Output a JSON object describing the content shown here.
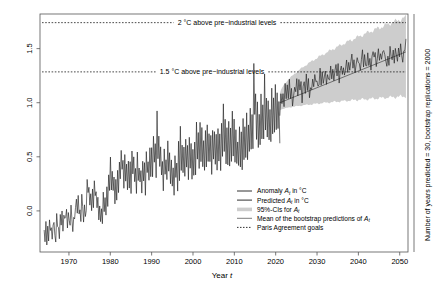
{
  "chart_data": {
    "type": "line",
    "title": "",
    "xlabel": "Year t",
    "ylabel": "",
    "xlim": [
      1963,
      2052
    ],
    "ylim": [
      -0.38,
      1.82
    ],
    "xticks": [
      "1970",
      "1980",
      "1990",
      "2000",
      "2010",
      "2020",
      "2030",
      "2040",
      "2050"
    ],
    "xtick_values": [
      1970,
      1980,
      1990,
      2000,
      2010,
      2020,
      2030,
      2040,
      2050
    ],
    "yticks": [
      "0.0",
      "0.5",
      "1.0",
      "1.5"
    ],
    "ytick_values": [
      0.0,
      0.5,
      1.0,
      1.5
    ],
    "grid": false,
    "legend_position": "bottom-right",
    "annotations": [
      {
        "label": "2 °C above pre−industrial levels",
        "y": 1.74,
        "style": "dotted"
      },
      {
        "label": "1.5 °C above pre−industrial levels",
        "y": 1.285,
        "style": "dotted"
      }
    ],
    "right_axis_note": "Number of years predicted = 30, bootstrap replications = 2000",
    "series": [
      {
        "name": "Anomaly A_t in °C",
        "type": "line",
        "color": "#1a1a1a",
        "x_start": 1964.0,
        "x_end": 2021.0,
        "values": [
          -0.22,
          -0.26,
          -0.14,
          -0.3,
          -0.18,
          -0.24,
          -0.1,
          -0.2,
          -0.12,
          -0.27,
          -0.15,
          -0.08,
          -0.18,
          -0.24,
          -0.05,
          -0.19,
          -0.12,
          -0.22,
          -0.08,
          -0.16,
          -0.04,
          -0.14,
          -0.06,
          -0.11,
          -0.1,
          -0.02,
          -0.15,
          0.02,
          -0.08,
          -0.13,
          0.04,
          -0.07,
          -0.16,
          -0.02,
          -0.09,
          0.01,
          0.06,
          -0.05,
          0.11,
          -0.03,
          0.02,
          -0.1,
          0.14,
          0.0,
          -0.06,
          0.08,
          -0.02,
          0.05,
          0.26,
          0.12,
          0.2,
          0.04,
          0.16,
          -0.02,
          0.22,
          0.07,
          0.3,
          0.1,
          0.18,
          0.0,
          0.1,
          -0.05,
          0.08,
          -0.12,
          0.02,
          -0.08,
          0.16,
          0.04,
          0.12,
          -0.04,
          0.2,
          0.06,
          0.34,
          0.16,
          0.46,
          0.22,
          0.38,
          0.14,
          0.3,
          0.05,
          0.26,
          0.1,
          0.42,
          0.2,
          0.5,
          0.28,
          0.6,
          0.34,
          0.44,
          0.2,
          0.52,
          0.3,
          0.4,
          0.18,
          0.48,
          0.26,
          0.42,
          0.2,
          0.55,
          0.3,
          0.46,
          0.24,
          0.38,
          0.16,
          0.5,
          0.28,
          0.44,
          0.22,
          0.35,
          0.14,
          0.48,
          0.26,
          0.4,
          0.18,
          0.58,
          0.32,
          0.5,
          0.28,
          0.62,
          0.36,
          0.54,
          0.3,
          0.7,
          0.42,
          0.6,
          0.34,
          0.88,
          0.5,
          0.66,
          0.38,
          0.58,
          0.3,
          0.46,
          0.22,
          0.56,
          0.3,
          0.48,
          0.24,
          0.62,
          0.34,
          0.54,
          0.28,
          0.45,
          0.2,
          0.38,
          0.14,
          0.52,
          0.26,
          0.44,
          0.2,
          0.6,
          0.32,
          0.78,
          0.42,
          0.64,
          0.36,
          0.56,
          0.3,
          0.68,
          0.38,
          0.58,
          0.32,
          0.72,
          0.4,
          0.62,
          0.34,
          0.56,
          0.3,
          0.66,
          0.36,
          0.86,
          0.48,
          0.7,
          0.4,
          0.8,
          0.44,
          0.74,
          0.42,
          0.64,
          0.36,
          0.7,
          0.4,
          0.82,
          0.46,
          0.76,
          0.42,
          0.68,
          0.38,
          0.78,
          0.44,
          0.7,
          0.4,
          0.66,
          0.36,
          0.76,
          0.42,
          0.7,
          0.38,
          0.84,
          0.46,
          1.02,
          0.56,
          0.8,
          0.46,
          0.72,
          0.4,
          0.82,
          0.46,
          0.76,
          0.42,
          0.88,
          0.5,
          0.8,
          0.46,
          0.74,
          0.42,
          0.68,
          0.4,
          0.78,
          0.44,
          0.72,
          0.42,
          0.86,
          0.5,
          0.8,
          0.46,
          0.9,
          0.52,
          0.84,
          0.5,
          0.96,
          0.56,
          0.9,
          0.54,
          1.38,
          0.88,
          1.1,
          0.7,
          0.98,
          0.62,
          0.9,
          0.58,
          1.06,
          0.68,
          1.0,
          0.64,
          1.24,
          0.78,
          1.08,
          0.7,
          1.0,
          0.66,
          0.94,
          0.62,
          1.1,
          0.72,
          1.02,
          0.68,
          1.16,
          0.76,
          1.06,
          0.72,
          0.98,
          0.66
        ]
      },
      {
        "name": "Predicted A_t in °C",
        "type": "line",
        "color": "#1a1a1a",
        "x_start": 2021.0,
        "x_end": 2051.5,
        "values": [
          0.86,
          1.08,
          0.96,
          1.12,
          1.0,
          1.16,
          1.04,
          1.2,
          1.08,
          1.18,
          1.02,
          1.14,
          0.98,
          1.1,
          1.18,
          1.06,
          1.2,
          1.1,
          1.22,
          1.08,
          1.16,
          1.04,
          1.12,
          1.2,
          1.1,
          1.24,
          1.12,
          1.2,
          1.08,
          1.18,
          1.1,
          1.22,
          1.14,
          1.26,
          1.16,
          1.24,
          1.12,
          1.2,
          1.28,
          1.18,
          1.26,
          1.16,
          1.22,
          1.3,
          1.2,
          1.28,
          1.18,
          1.24,
          1.32,
          1.22,
          1.3,
          1.2,
          1.26,
          1.34,
          1.24,
          1.32,
          1.22,
          1.3,
          1.38,
          1.28,
          1.34,
          1.24,
          1.3,
          1.4,
          1.3,
          1.36,
          1.26,
          1.34,
          1.42,
          1.3,
          1.38,
          1.28,
          1.36,
          1.44,
          1.34,
          1.4,
          1.3,
          1.38,
          1.46,
          1.36,
          1.42,
          1.32,
          1.38,
          1.46,
          1.38,
          1.44,
          1.34,
          1.42,
          1.5,
          1.4,
          1.46,
          1.36,
          1.42,
          1.5,
          1.42,
          1.48,
          1.38,
          1.46,
          1.52,
          1.44,
          1.4,
          1.34,
          1.46,
          1.38,
          1.5,
          1.42,
          1.36,
          1.48,
          1.4,
          1.52,
          1.44,
          1.38,
          1.5,
          1.42,
          1.54,
          1.46,
          1.4,
          1.52,
          1.44,
          1.56
        ]
      },
      {
        "name": "Mean of the bootstrap predictions of A_t",
        "type": "line",
        "color": "#6e6e6e",
        "x_start": 2021.0,
        "x_end": 2051.5,
        "y_start": 1.0,
        "y_end": 1.47
      },
      {
        "name": "95%-CIs for A_t",
        "type": "band",
        "color": "#cdcdcd",
        "x_start": 2021.0,
        "x_end": 2051.5,
        "lower_start": 0.93,
        "lower_end": 1.06,
        "upper_start": 1.08,
        "upper_end": 1.79
      }
    ],
    "legend": [
      {
        "label_prefix": "Anomaly ",
        "symbol": "A",
        "subscript": "t",
        "label_suffix": " in °C",
        "marker": "line",
        "color": "#1a1a1a"
      },
      {
        "label_prefix": "Predicted ",
        "symbol": "A",
        "subscript": "t",
        "label_suffix": " in °C",
        "marker": "line",
        "color": "#1a1a1a"
      },
      {
        "label_prefix": "95%-CIs for  ",
        "symbol": "A",
        "subscript": "t",
        "label_suffix": "",
        "marker": "band",
        "color": "#cdcdcd"
      },
      {
        "label_prefix": "Mean of the bootstrap predictions of ",
        "symbol": "A",
        "subscript": "t",
        "label_suffix": "",
        "marker": "line",
        "color": "#6e6e6e"
      },
      {
        "label_prefix": "Paris Agreement goals",
        "symbol": "",
        "subscript": "",
        "label_suffix": "",
        "marker": "dotted",
        "color": "#1a1a1a"
      }
    ]
  },
  "axis": {
    "x_title_text": "Year ",
    "x_title_italic": "t",
    "y_ticks": [
      "0.0",
      "0.5",
      "1.0",
      "1.5"
    ],
    "x_ticks": [
      "1970",
      "1980",
      "1990",
      "2000",
      "2010",
      "2020",
      "2030",
      "2040",
      "2050"
    ]
  },
  "labels": {
    "goal_2c": "2 °C above pre−industrial levels",
    "goal_15c": "1.5 °C above pre−industrial levels",
    "right_note": "Number of years predicted = 30, bootstrap replications = 2000"
  },
  "colors": {
    "axis": "#555555",
    "data_line": "#1a1a1a",
    "mean_line": "#6e6e6e",
    "ci_band": "#cdcdcd",
    "background": "#ffffff"
  }
}
